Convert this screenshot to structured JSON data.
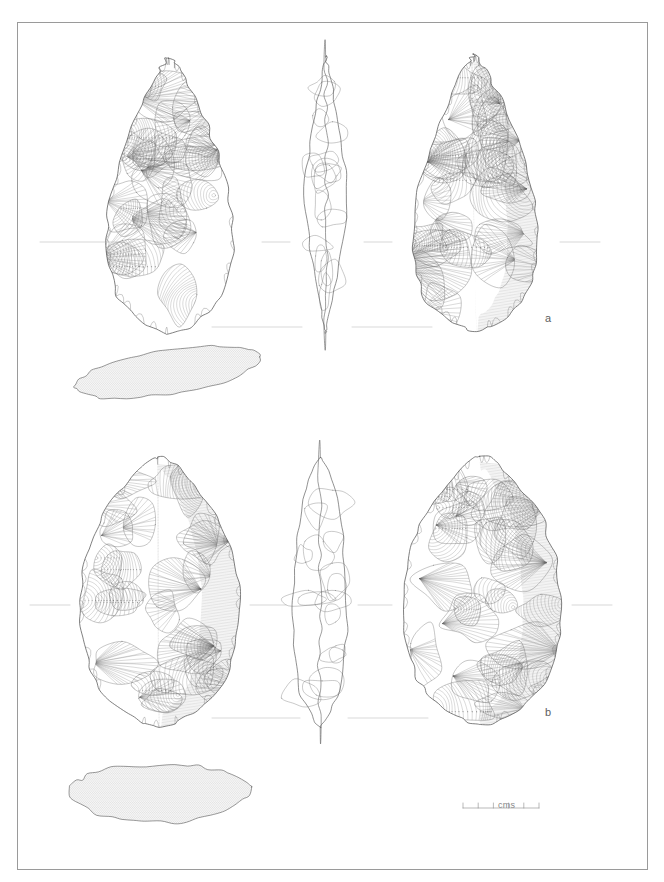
{
  "plate": {
    "type": "archaeological-lithic-illustration",
    "description": "Line-drawing plate of two Acheulean bifaces (handaxes), each shown in three aspects with a transverse cross-section below",
    "background_color": "#ffffff",
    "ink_color": "#6b6b6b",
    "outline_color": "#555555",
    "frame": {
      "visible": true,
      "color": "#9a9a9a",
      "x": 17,
      "y": 22,
      "width": 631,
      "height": 848
    }
  },
  "specimens": [
    {
      "id": "a",
      "label": "a",
      "label_x": 545,
      "label_y": 312,
      "form": "pointed ovate / cordiform handaxe",
      "views": [
        {
          "name": "obverse-face",
          "aspect": "left",
          "cx": 170,
          "cy": 195,
          "half_w": 82,
          "half_h": 138
        },
        {
          "name": "lateral-profile",
          "aspect": "centre",
          "cx": 326,
          "cy": 195,
          "half_w": 22,
          "half_h": 138
        },
        {
          "name": "reverse-face",
          "aspect": "right",
          "cx": 475,
          "cy": 193,
          "half_w": 80,
          "half_h": 138
        }
      ],
      "section": {
        "name": "transverse-section",
        "cx": 168,
        "cy": 372,
        "half_w": 92,
        "half_h": 26,
        "profile": "lenticular-flat"
      },
      "baseline_y": 327,
      "registration_y": 242
    },
    {
      "id": "b",
      "label": "b",
      "label_x": 545,
      "label_y": 706,
      "form": "broad ovate handaxe",
      "views": [
        {
          "name": "obverse-face",
          "aspect": "left",
          "cx": 160,
          "cy": 592,
          "half_w": 88,
          "half_h": 135
        },
        {
          "name": "lateral-profile",
          "aspect": "centre",
          "cx": 320,
          "cy": 592,
          "half_w": 30,
          "half_h": 135
        },
        {
          "name": "reverse-face",
          "aspect": "right",
          "cx": 482,
          "cy": 590,
          "half_w": 88,
          "half_h": 135
        }
      ],
      "section": {
        "name": "transverse-section",
        "cx": 160,
        "cy": 789,
        "half_w": 92,
        "half_h": 34,
        "profile": "thick-angular"
      },
      "baseline_y": 718,
      "registration_y": 605
    }
  ],
  "scale_bar": {
    "name": "scale-bar",
    "unit_label": "cms",
    "x": 463,
    "y": 808,
    "length_px": 76,
    "divisions": 5,
    "tick_count": 6,
    "label_x": 498,
    "label_y": 800,
    "color": "#8a8a8a"
  }
}
